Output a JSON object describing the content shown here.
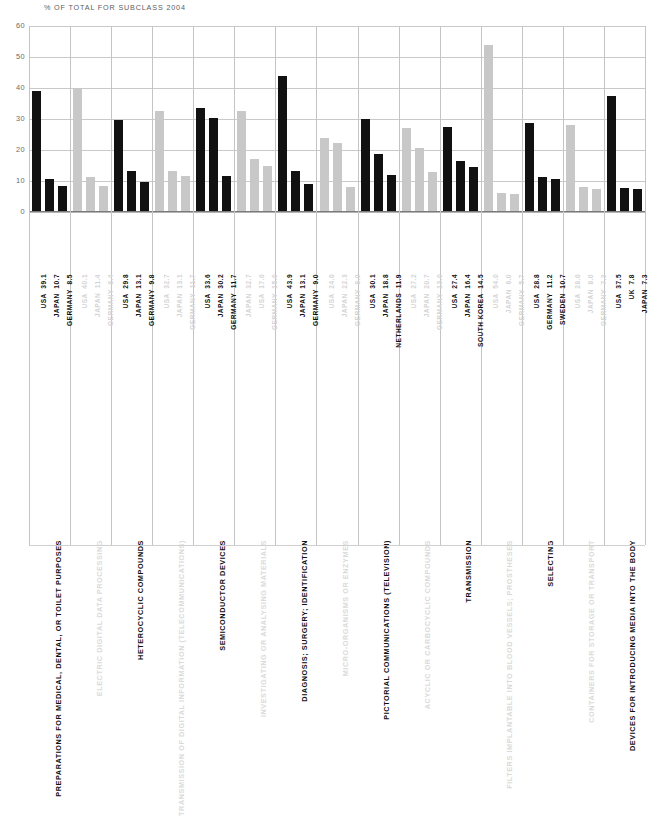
{
  "chart_data": {
    "type": "bar",
    "title": "% OF TOTAL FOR SUBCLASS 2004",
    "xlabel": "",
    "ylabel": "",
    "ylim": [
      0,
      60
    ],
    "yticks": [
      0,
      10,
      20,
      30,
      40,
      50,
      60
    ],
    "grid": true,
    "legend": "none",
    "orientation": "vertical",
    "note": "Grouped bar chart; alternating groups rendered dark (highlighted) and light grey (de-emphasised). Each group shows the top three countries' share of total patents for that subclass.",
    "colors": {
      "highlight": "#111111",
      "muted": "#c8c8c8",
      "grid": "#b4b4b4",
      "title_text": "#5d5d5d"
    },
    "groups": [
      {
        "category": "PREPARATIONS FOR MEDICAL, DENTAL, OR TOILET PURPOSES",
        "emphasis": "dark",
        "bars": [
          {
            "country": "USA",
            "value": 39.1
          },
          {
            "country": "JAPAN",
            "value": 10.7
          },
          {
            "country": "GERMANY",
            "value": 8.5
          }
        ]
      },
      {
        "category": "ELECTRIC DIGITAL DATA PROCESSING",
        "emphasis": "light",
        "bars": [
          {
            "country": "USA",
            "value": 40.1
          },
          {
            "country": "JAPAN",
            "value": 11.4
          },
          {
            "country": "GERMANY",
            "value": 8.4
          }
        ]
      },
      {
        "category": "HETEROCYCLIC COMPOUNDS",
        "emphasis": "dark",
        "bars": [
          {
            "country": "USA",
            "value": 29.8
          },
          {
            "country": "JAPAN",
            "value": 13.1
          },
          {
            "country": "GERMANY",
            "value": 9.8
          }
        ]
      },
      {
        "category": "TRANSMISSION OF DIGITAL INFORMATION (TELECOMMUNICATIONS)",
        "emphasis": "light",
        "bars": [
          {
            "country": "USA",
            "value": 32.7
          },
          {
            "country": "JAPAN",
            "value": 13.1
          },
          {
            "country": "GERMANY",
            "value": 11.7
          }
        ]
      },
      {
        "category": "SEMICONDUCTOR DEVICES",
        "emphasis": "dark",
        "bars": [
          {
            "country": "USA",
            "value": 33.6
          },
          {
            "country": "JAPAN",
            "value": 30.2
          },
          {
            "country": "GERMANY",
            "value": 11.7
          }
        ]
      },
      {
        "category": "INVESTIGATING OR ANALYSING MATERIALS",
        "emphasis": "light",
        "bars": [
          {
            "country": "JAPAN",
            "value": 32.7
          },
          {
            "country": "USA",
            "value": 17.0
          },
          {
            "country": "GERMANY",
            "value": 15.0
          }
        ]
      },
      {
        "category": "DIAGNOSIS; SURGERY; IDENTIFICATION",
        "emphasis": "dark",
        "bars": [
          {
            "country": "USA",
            "value": 43.9
          },
          {
            "country": "JAPAN",
            "value": 13.1
          },
          {
            "country": "GERMANY",
            "value": 9.0
          }
        ]
      },
      {
        "category": "MICRO-ORGANISMS OR ENZYMES",
        "emphasis": "light",
        "bars": [
          {
            "country": "USA",
            "value": 24.0
          },
          {
            "country": "JAPAN",
            "value": 22.3
          },
          {
            "country": "GERMANY",
            "value": 8.0
          }
        ]
      },
      {
        "category": "PICTORIAL COMMUNICATIONS (TELEVISION)",
        "emphasis": "dark",
        "bars": [
          {
            "country": "USA",
            "value": 30.1
          },
          {
            "country": "JAPAN",
            "value": 18.8
          },
          {
            "country": "NETHERLANDS",
            "value": 11.9
          }
        ]
      },
      {
        "category": "ACYCLIC OR CARBOCYCLIC COMPOUNDS",
        "emphasis": "light",
        "bars": [
          {
            "country": "USA",
            "value": 27.2
          },
          {
            "country": "JAPAN",
            "value": 20.7
          },
          {
            "country": "GERMANY",
            "value": 13.0
          }
        ]
      },
      {
        "category": "TRANSMISSION",
        "emphasis": "dark",
        "bars": [
          {
            "country": "USA",
            "value": 27.4
          },
          {
            "country": "JAPAN",
            "value": 16.4
          },
          {
            "country": "SOUTH KOREA",
            "value": 14.5
          }
        ]
      },
      {
        "category": "FILTERS IMPLANTABLE INTO BLOOD VESSELS; PROSTHESES",
        "emphasis": "light",
        "bars": [
          {
            "country": "USA",
            "value": 54.0
          },
          {
            "country": "JAPAN",
            "value": 6.0
          },
          {
            "country": "GERMANY",
            "value": 5.7
          }
        ]
      },
      {
        "category": "SELECTING",
        "emphasis": "dark",
        "bars": [
          {
            "country": "USA",
            "value": 28.8
          },
          {
            "country": "GERMANY",
            "value": 11.2
          },
          {
            "country": "SWEDEN",
            "value": 10.7
          }
        ]
      },
      {
        "category": "CONTAINERS FOR STORAGE OR TRANSPORT",
        "emphasis": "light",
        "bars": [
          {
            "country": "USA",
            "value": 28.0
          },
          {
            "country": "JAPAN",
            "value": 8.0
          },
          {
            "country": "GERMANY",
            "value": 7.3
          }
        ]
      },
      {
        "category": "DEVICES FOR INTRODUCING MEDIA INTO THE BODY",
        "emphasis": "dark",
        "bars": [
          {
            "country": "USA",
            "value": 37.5
          },
          {
            "country": "UK",
            "value": 7.8
          },
          {
            "country": "JAPAN",
            "value": 7.3
          }
        ]
      }
    ]
  }
}
